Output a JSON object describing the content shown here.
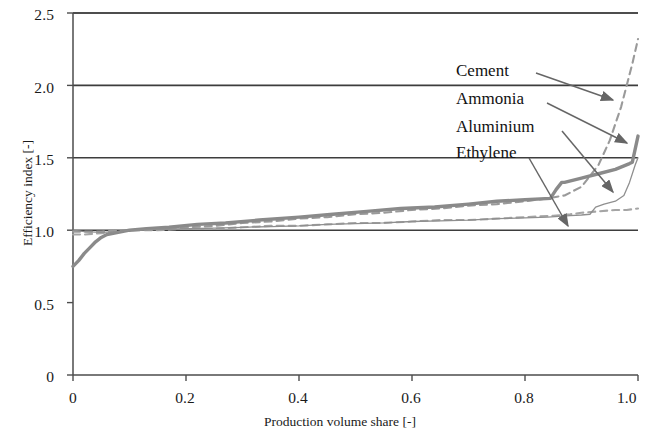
{
  "chart_data": {
    "type": "line",
    "title": "",
    "xlabel": "Production volume share [-]",
    "ylabel": "Efficiency index [-]",
    "xlim": [
      0,
      1.0
    ],
    "ylim": [
      0,
      2.5
    ],
    "xticks": [
      "0",
      "0.2",
      "0.4",
      "0.6",
      "0.8",
      "1.0"
    ],
    "xtick_values": [
      0,
      0.2,
      0.4,
      0.6,
      0.8,
      1.0
    ],
    "yticks": [
      "0",
      "0.5",
      "1.0",
      "1.5",
      "2.0",
      "2.5"
    ],
    "ytick_values": [
      0,
      0.5,
      1.0,
      1.5,
      2.0,
      2.5
    ],
    "grid": "horizontal-major",
    "legend_position": "inline-annotations-upper-right",
    "series": [
      {
        "name": "Cement",
        "style": "dashed",
        "color": "#9a9a9a",
        "x": [
          0.0,
          0.02,
          0.05,
          0.08,
          0.1,
          0.15,
          0.2,
          0.25,
          0.3,
          0.35,
          0.4,
          0.45,
          0.5,
          0.55,
          0.6,
          0.65,
          0.7,
          0.75,
          0.8,
          0.84,
          0.87,
          0.9,
          0.93,
          0.95,
          0.97,
          0.99,
          1.0
        ],
        "y": [
          0.99,
          0.99,
          0.99,
          1.0,
          1.0,
          1.01,
          1.02,
          1.03,
          1.05,
          1.06,
          1.08,
          1.09,
          1.11,
          1.12,
          1.14,
          1.15,
          1.17,
          1.18,
          1.2,
          1.22,
          1.24,
          1.3,
          1.45,
          1.62,
          1.85,
          2.15,
          2.32
        ]
      },
      {
        "name": "Ammonia",
        "style": "dashed",
        "color": "#a5a5a5",
        "x": [
          0.0,
          0.02,
          0.05,
          0.08,
          0.1,
          0.15,
          0.2,
          0.25,
          0.3,
          0.35,
          0.4,
          0.45,
          0.5,
          0.55,
          0.6,
          0.65,
          0.7,
          0.75,
          0.8,
          0.85,
          0.88,
          0.9,
          0.93,
          0.96,
          0.98,
          1.0
        ],
        "y": [
          0.97,
          0.97,
          0.98,
          0.99,
          1.0,
          1.0,
          1.01,
          1.01,
          1.02,
          1.03,
          1.03,
          1.04,
          1.05,
          1.05,
          1.06,
          1.07,
          1.07,
          1.08,
          1.09,
          1.1,
          1.11,
          1.12,
          1.13,
          1.14,
          1.14,
          1.15
        ]
      },
      {
        "name": "Aluminium",
        "style": "thick-solid",
        "color": "#8a8a8a",
        "x": [
          0.0,
          0.01,
          0.02,
          0.03,
          0.04,
          0.05,
          0.06,
          0.08,
          0.1,
          0.13,
          0.17,
          0.22,
          0.27,
          0.33,
          0.4,
          0.46,
          0.52,
          0.58,
          0.64,
          0.7,
          0.75,
          0.8,
          0.845,
          0.855,
          0.865,
          0.87,
          0.9,
          0.93,
          0.96,
          0.985,
          0.99,
          1.0
        ],
        "y": [
          0.75,
          0.79,
          0.84,
          0.88,
          0.92,
          0.95,
          0.97,
          0.985,
          1.0,
          1.01,
          1.02,
          1.04,
          1.05,
          1.07,
          1.09,
          1.11,
          1.13,
          1.15,
          1.16,
          1.18,
          1.2,
          1.21,
          1.22,
          1.28,
          1.33,
          1.33,
          1.36,
          1.39,
          1.42,
          1.46,
          1.47,
          1.65
        ]
      },
      {
        "name": "Ethylene",
        "style": "thin-solid",
        "color": "#8f8f8f",
        "x": [
          0.0,
          0.02,
          0.05,
          0.08,
          0.1,
          0.15,
          0.2,
          0.25,
          0.3,
          0.35,
          0.4,
          0.45,
          0.5,
          0.55,
          0.6,
          0.65,
          0.7,
          0.75,
          0.8,
          0.84,
          0.86,
          0.88,
          0.9,
          0.915,
          0.925,
          0.94,
          0.96,
          0.975,
          0.985,
          0.995,
          1.0
        ],
        "y": [
          1.0,
          0.99,
          0.985,
          0.99,
          1.0,
          1.005,
          1.01,
          1.015,
          1.02,
          1.025,
          1.03,
          1.04,
          1.045,
          1.05,
          1.06,
          1.065,
          1.07,
          1.08,
          1.085,
          1.09,
          1.095,
          1.1,
          1.105,
          1.11,
          1.16,
          1.18,
          1.2,
          1.24,
          1.33,
          1.45,
          1.5
        ]
      }
    ],
    "annotations": [
      {
        "label": "Cement",
        "text_x": 456,
        "text_y": 78,
        "arrow_from_x": 536,
        "arrow_from_y": 73,
        "arrow_to_x": 613,
        "arrow_to_y": 100
      },
      {
        "label": "Ammonia",
        "text_x": 456,
        "text_y": 106,
        "arrow_from_x": 547,
        "arrow_from_y": 103,
        "arrow_to_x": 627,
        "arrow_to_y": 143
      },
      {
        "label": "Aluminium",
        "text_x": 456,
        "text_y": 134,
        "arrow_from_x": 562,
        "arrow_from_y": 131,
        "arrow_to_x": 613,
        "arrow_to_y": 192
      },
      {
        "label": "Ethylene",
        "text_x": 456,
        "text_y": 160,
        "arrow_from_x": 529,
        "arrow_from_y": 158,
        "arrow_to_x": 568,
        "arrow_to_y": 226
      }
    ]
  },
  "axis": {
    "frame_color": "#4d4d4d",
    "gridline_color": "#3d3d3d"
  }
}
